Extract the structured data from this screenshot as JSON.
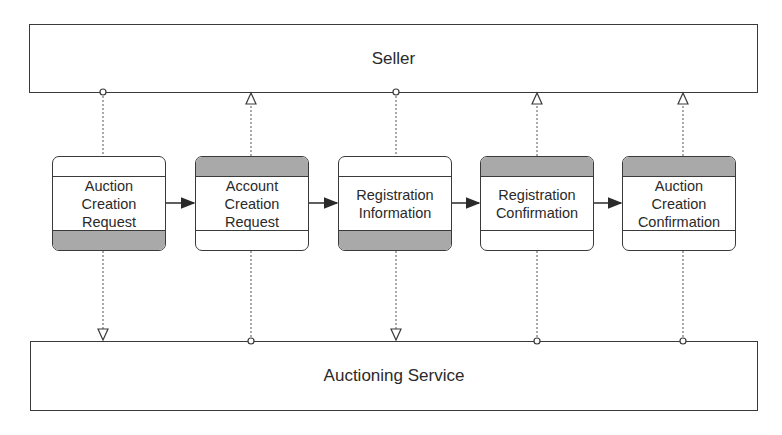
{
  "diagram": {
    "top_lane": {
      "label": "Seller"
    },
    "bottom_lane": {
      "label": "Auctioning Service"
    },
    "cards": [
      {
        "label": "Auction\nCreation\nRequest",
        "shaded_band": "bottom",
        "source": "Seller",
        "target": "Auctioning Service"
      },
      {
        "label": "Account\nCreation\nRequest",
        "shaded_band": "top",
        "source": "Auctioning Service",
        "target": "Seller"
      },
      {
        "label": "Registration\nInformation",
        "shaded_band": "bottom",
        "source": "Seller",
        "target": "Auctioning Service"
      },
      {
        "label": "Registration\nConfirmation",
        "shaded_band": "top",
        "source": "Auctioning Service",
        "target": "Seller"
      },
      {
        "label": "Auction\nCreation\nConfirmation",
        "shaded_band": "top",
        "source": "Auctioning Service",
        "target": "Seller"
      }
    ],
    "sequence_arrows": [
      {
        "from": "Auction Creation Request",
        "to": "Account Creation Request"
      },
      {
        "from": "Account Creation Request",
        "to": "Registration Information"
      },
      {
        "from": "Registration Information",
        "to": "Registration Confirmation"
      },
      {
        "from": "Registration Confirmation",
        "to": "Auction Creation Confirmation"
      }
    ],
    "colors": {
      "line": "#3a3a3a",
      "shade": "#a9a9a9",
      "background": "#ffffff"
    }
  }
}
